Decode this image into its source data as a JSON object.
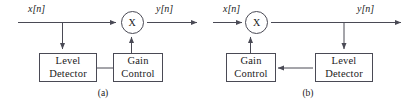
{
  "figure": {
    "panels": [
      {
        "id": "a",
        "caption": "(a)",
        "input_label": "x[n]",
        "output_label": "y[n]",
        "multiplier_symbol": "X",
        "blocks": [
          {
            "name": "level-detector",
            "line1": "Level",
            "line2": "Detector"
          },
          {
            "name": "gain-control",
            "line1": "Gain",
            "line2": "Control"
          }
        ]
      },
      {
        "id": "b",
        "caption": "(b)",
        "input_label": "x[n]",
        "output_label": "y[n]",
        "multiplier_symbol": "X",
        "blocks": [
          {
            "name": "gain-control",
            "line1": "Gain",
            "line2": "Control"
          },
          {
            "name": "level-detector",
            "line1": "Level",
            "line2": "Detector"
          }
        ]
      }
    ]
  },
  "colors": {
    "background": "#ffffff",
    "stroke": "#4a4a55",
    "text": "#1a1a1a"
  }
}
